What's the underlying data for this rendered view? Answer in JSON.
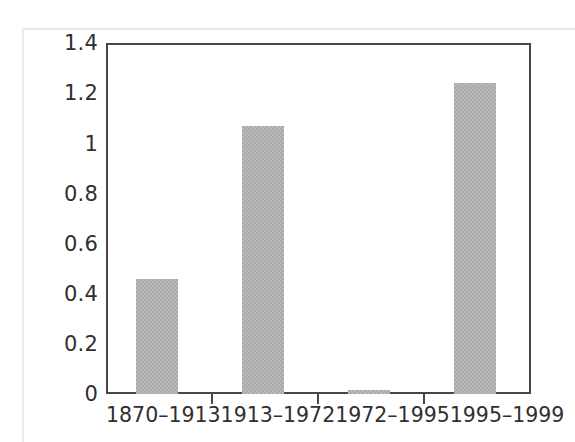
{
  "chart_data": {
    "type": "bar",
    "title": "",
    "subtitle": "",
    "xlabel": "",
    "ylabel": "",
    "categories": [
      "1870–1913",
      "1913–1972",
      "1972–1995",
      "1995–1999"
    ],
    "values": [
      0.46,
      1.07,
      0.015,
      1.24
    ],
    "series": [
      {
        "name": "",
        "values": [
          0.46,
          1.07,
          0.015,
          1.24
        ]
      }
    ],
    "ylim": [
      0,
      1.4
    ],
    "yticks": [
      "0",
      "0.2",
      "0.4",
      "0.6",
      "0.8",
      "1",
      "1.2",
      "1.4"
    ],
    "ytick_values": [
      0,
      0.2,
      0.4,
      0.6,
      0.8,
      1.0,
      1.2,
      1.4
    ],
    "grid": false,
    "legend": "none",
    "bar_color": "#aaaaaa",
    "axis_color": "#474747",
    "background_color": "#ffffff"
  },
  "axis": {
    "y_labels": [
      "1.4",
      "1.2",
      "1",
      "0.8",
      "0.6",
      "0.4",
      "0.2",
      "0"
    ],
    "x_labels": [
      "1870–1913",
      "1913–1972",
      "1972–1995",
      "1995–1999"
    ]
  }
}
